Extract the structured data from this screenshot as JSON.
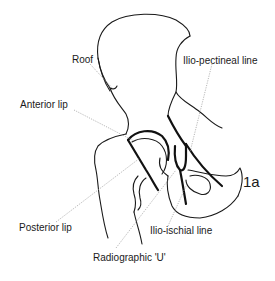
{
  "figure": {
    "number": "1a",
    "labels": {
      "roof": "Roof",
      "anterior_lip": "Anterior lip",
      "posterior_lip": "Posterior lip",
      "radiographic_u": "Radiographic 'U'",
      "ilio_pectineal_line": "Ilio-pectineal line",
      "ilio_ischial_line": "Ilio-ischial line"
    }
  },
  "colors": {
    "line": "#1a1a1a",
    "leader": "#9a9a9a",
    "background": "#ffffff"
  }
}
